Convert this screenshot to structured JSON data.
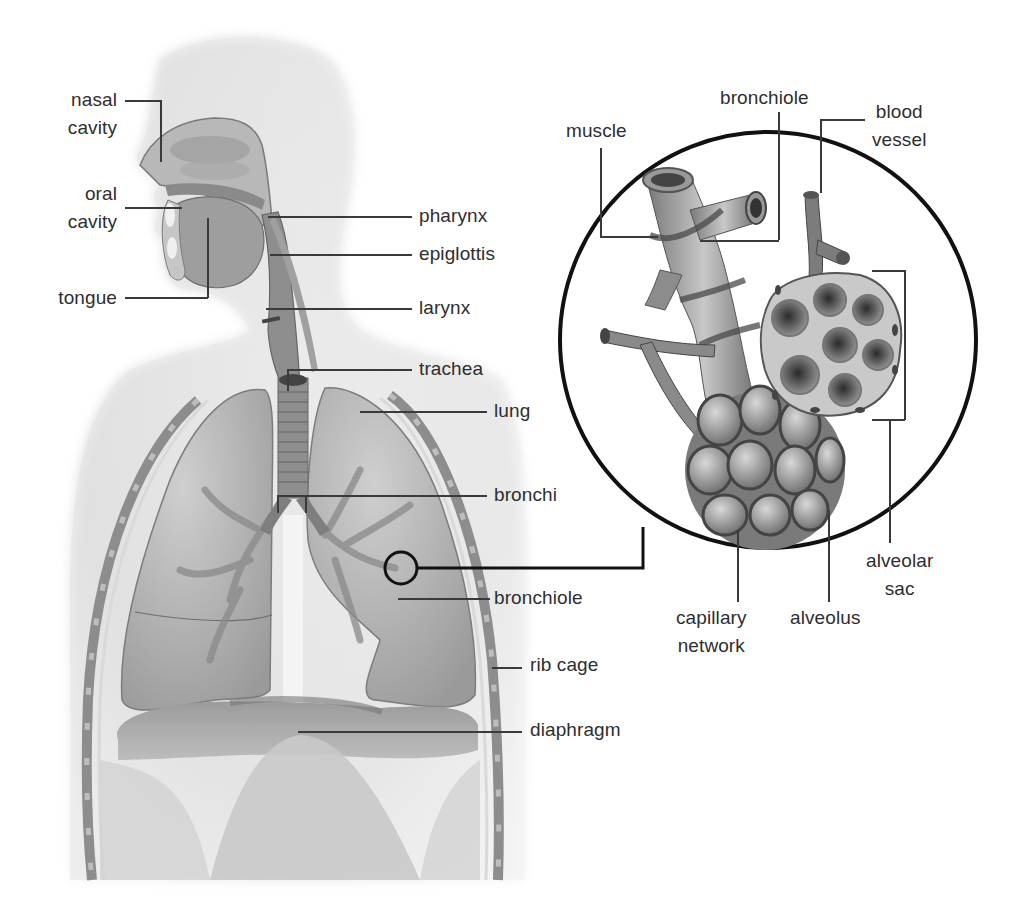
{
  "diagram": {
    "main_figure": {
      "labels": {
        "nasal_cavity": [
          "nasal",
          "cavity"
        ],
        "oral_cavity": [
          "oral",
          "cavity"
        ],
        "tongue": "tongue",
        "pharynx": "pharynx",
        "epiglottis": "epiglottis",
        "larynx": "larynx",
        "trachea": "trachea",
        "lung": "lung",
        "bronchi": "bronchi",
        "bronchiole": "bronchiole",
        "rib_cage": "rib cage",
        "diaphragm": "diaphragm"
      }
    },
    "inset": {
      "description": "Magnified view of bronchiole ending in alveolar sac",
      "labels": {
        "muscle": "muscle",
        "bronchiole": "bronchiole",
        "blood_vessel": [
          "blood",
          "vessel"
        ],
        "alveolar_sac": [
          "alveolar",
          "sac"
        ],
        "capillary_network": [
          "capillary",
          "network"
        ],
        "alveolus": "alveolus"
      }
    },
    "colors": {
      "background": "#ffffff",
      "tissue_light": "#d9d9d9",
      "tissue_mid": "#a6a6a6",
      "tissue_dark": "#6e6e6e",
      "leader_line": "#3a3a3a",
      "circle_outline": "#111111"
    }
  }
}
